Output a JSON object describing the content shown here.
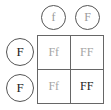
{
  "punnett": {
    "top_alleles": [
      "f",
      "F"
    ],
    "side_alleles": [
      "F",
      "F"
    ],
    "cells": [
      {
        "genotype": "Ff",
        "emphasis": false
      },
      {
        "genotype": "FF",
        "emphasis": false
      },
      {
        "genotype": "Ff",
        "emphasis": false
      },
      {
        "genotype": "FF",
        "emphasis": true
      }
    ]
  },
  "colors": {
    "border": "#666666",
    "muted_text": "#a5a5a5",
    "dark_text": "#222222"
  }
}
